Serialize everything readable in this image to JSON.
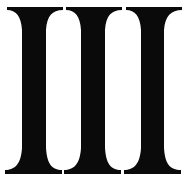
{
  "glyph": {
    "text": "III",
    "meaning": "Roman numeral three",
    "color": "#0a0a0a",
    "background": "#ffffff"
  }
}
